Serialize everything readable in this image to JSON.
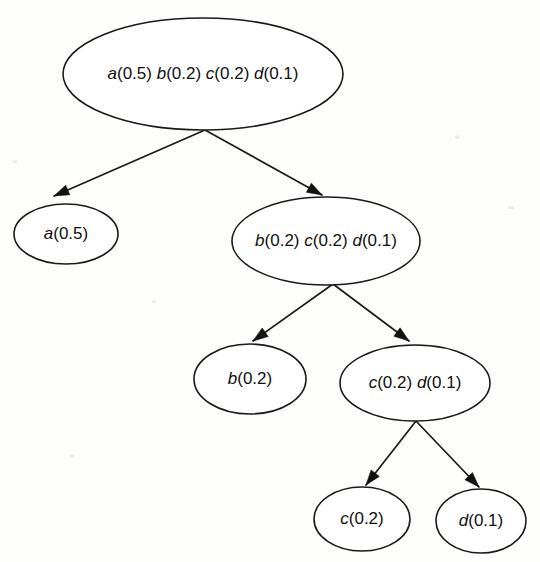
{
  "figure": {
    "type": "tree-diagram",
    "background_color": "#fdfdfc",
    "node_fill": "#ffffff",
    "node_stroke": "#1a1a1a",
    "edge_color": "#1a1a1a"
  },
  "nodes": [
    {
      "id": "root",
      "level": 0,
      "cx": 203,
      "cy": 74,
      "rx": 140,
      "ry": 56,
      "text": "a(0.5) b(0.2) c(0.2) d(0.1)",
      "symbols": [
        "a",
        "b",
        "c",
        "d"
      ],
      "probabilities": [
        0.5,
        0.2,
        0.2,
        0.1
      ],
      "parts": [
        {
          "sym": "a",
          "prob": "(0.5)"
        },
        {
          "sym": "b",
          "prob": "(0.2)"
        },
        {
          "sym": "c",
          "prob": "(0.2)"
        },
        {
          "sym": "d",
          "prob": "(0.1)"
        }
      ],
      "is_leaf": false
    },
    {
      "id": "n-a",
      "level": 1,
      "cx": 66,
      "cy": 234,
      "rx": 52,
      "ry": 30,
      "text": "a(0.5)",
      "symbols": [
        "a"
      ],
      "probabilities": [
        0.5
      ],
      "parts": [
        {
          "sym": "a",
          "prob": "(0.5)"
        }
      ],
      "is_leaf": true
    },
    {
      "id": "n-bcd",
      "level": 1,
      "cx": 326,
      "cy": 241,
      "rx": 94,
      "ry": 44,
      "text": "b(0.2) c(0.2) d(0.1)",
      "symbols": [
        "b",
        "c",
        "d"
      ],
      "probabilities": [
        0.2,
        0.2,
        0.1
      ],
      "parts": [
        {
          "sym": "b",
          "prob": "(0.2)"
        },
        {
          "sym": "c",
          "prob": "(0.2)"
        },
        {
          "sym": "d",
          "prob": "(0.1)"
        }
      ],
      "is_leaf": false
    },
    {
      "id": "n-b",
      "level": 2,
      "cx": 250,
      "cy": 379,
      "rx": 56,
      "ry": 35,
      "text": "b(0.2)",
      "symbols": [
        "b"
      ],
      "probabilities": [
        0.2
      ],
      "parts": [
        {
          "sym": "b",
          "prob": "(0.2)"
        }
      ],
      "is_leaf": true
    },
    {
      "id": "n-cd",
      "level": 2,
      "cx": 415,
      "cy": 383,
      "rx": 75,
      "ry": 38,
      "text": "c(0.2) d(0.1)",
      "symbols": [
        "c",
        "d"
      ],
      "probabilities": [
        0.2,
        0.1
      ],
      "parts": [
        {
          "sym": "c",
          "prob": "(0.2)"
        },
        {
          "sym": "d",
          "prob": "(0.1)"
        }
      ],
      "is_leaf": false
    },
    {
      "id": "n-c",
      "level": 3,
      "cx": 362,
      "cy": 519,
      "rx": 48,
      "ry": 32,
      "text": "c(0.2)",
      "symbols": [
        "c"
      ],
      "probabilities": [
        0.2
      ],
      "parts": [
        {
          "sym": "c",
          "prob": "(0.2)"
        }
      ],
      "is_leaf": true
    },
    {
      "id": "n-d",
      "level": 3,
      "cx": 481,
      "cy": 521,
      "rx": 45,
      "ry": 32,
      "text": "d(0.1)",
      "symbols": [
        "d"
      ],
      "probabilities": [
        0.1
      ],
      "parts": [
        {
          "sym": "d",
          "prob": "(0.1)"
        }
      ],
      "is_leaf": true
    }
  ],
  "edges": [
    {
      "id": "e-root-a",
      "from": "root",
      "to": "n-a",
      "x1": 205,
      "y1": 130,
      "x2": 54,
      "y2": 196
    },
    {
      "id": "e-root-bcd",
      "from": "root",
      "to": "n-bcd",
      "x1": 205,
      "y1": 130,
      "x2": 322,
      "y2": 195
    },
    {
      "id": "e-bcd-b",
      "from": "n-bcd",
      "to": "n-b",
      "x1": 333,
      "y1": 284,
      "x2": 253,
      "y2": 341
    },
    {
      "id": "e-bcd-cd",
      "from": "n-bcd",
      "to": "n-cd",
      "x1": 333,
      "y1": 284,
      "x2": 409,
      "y2": 341
    },
    {
      "id": "e-cd-c",
      "from": "n-cd",
      "to": "n-c",
      "x1": 416,
      "y1": 421,
      "x2": 366,
      "y2": 485
    },
    {
      "id": "e-cd-d",
      "from": "n-cd",
      "to": "n-d",
      "x1": 416,
      "y1": 421,
      "x2": 479,
      "y2": 487
    }
  ]
}
